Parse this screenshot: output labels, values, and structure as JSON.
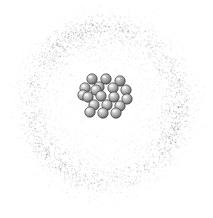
{
  "figure": {
    "background_color": "#ffffff",
    "width": 213,
    "height": 218,
    "caption": ""
  },
  "electron_cloud": {
    "label": "electron cloud",
    "shape": "annulus",
    "center_x": 105,
    "center_y": 104,
    "inner_radius": 48,
    "peak_radius": 76,
    "outer_radius": 104,
    "texture": "stipple",
    "dot_count": 19000,
    "dot_min_size": 0.45,
    "dot_max_size": 1.25,
    "color_dark": "#4a4a4a",
    "color_mid": "#777777",
    "color_light": "#b4b4b4",
    "max_opacity": 0.62,
    "ellipse_x_scale": 1.0,
    "ellipse_y_scale": 1.02
  },
  "nucleus": {
    "label": "nucleus",
    "center_x": 106,
    "center_y": 95,
    "particle_radius": 5.2,
    "particle_count": 19,
    "fill_light": "#e8e8e8",
    "fill_mid": "#a6a6a6",
    "fill_dark": "#5e5e5e",
    "stroke": "#3b3b3b",
    "stroke_width": 0.8,
    "highlight_color": "#f5f5f5",
    "particles": [
      {
        "name": "nucleon-1",
        "cx": 92,
        "cy": 79,
        "depth": "back"
      },
      {
        "name": "nucleon-2",
        "cx": 106,
        "cy": 79,
        "depth": "back"
      },
      {
        "name": "nucleon-3",
        "cx": 120,
        "cy": 81,
        "depth": "back"
      },
      {
        "name": "nucleon-4",
        "cx": 85,
        "cy": 88,
        "depth": "mid"
      },
      {
        "name": "nucleon-5",
        "cx": 99,
        "cy": 87,
        "depth": "mid"
      },
      {
        "name": "nucleon-6",
        "cx": 113,
        "cy": 88,
        "depth": "mid"
      },
      {
        "name": "nucleon-7",
        "cx": 126,
        "cy": 90,
        "depth": "mid"
      },
      {
        "name": "nucleon-8",
        "cx": 88,
        "cy": 97,
        "depth": "front"
      },
      {
        "name": "nucleon-9",
        "cx": 101,
        "cy": 96,
        "depth": "front"
      },
      {
        "name": "nucleon-10",
        "cx": 114,
        "cy": 97,
        "depth": "front"
      },
      {
        "name": "nucleon-11",
        "cx": 127,
        "cy": 99,
        "depth": "front"
      },
      {
        "name": "nucleon-12",
        "cx": 83,
        "cy": 95,
        "depth": "mid"
      },
      {
        "name": "nucleon-13",
        "cx": 94,
        "cy": 105,
        "depth": "front"
      },
      {
        "name": "nucleon-14",
        "cx": 107,
        "cy": 105,
        "depth": "front"
      },
      {
        "name": "nucleon-15",
        "cx": 120,
        "cy": 106,
        "depth": "front"
      },
      {
        "name": "nucleon-16",
        "cx": 90,
        "cy": 112,
        "depth": "front"
      },
      {
        "name": "nucleon-17",
        "cx": 103,
        "cy": 113,
        "depth": "front"
      },
      {
        "name": "nucleon-18",
        "cx": 116,
        "cy": 113,
        "depth": "front"
      },
      {
        "name": "nucleon-19",
        "cx": 96,
        "cy": 90,
        "depth": "mid"
      }
    ]
  }
}
